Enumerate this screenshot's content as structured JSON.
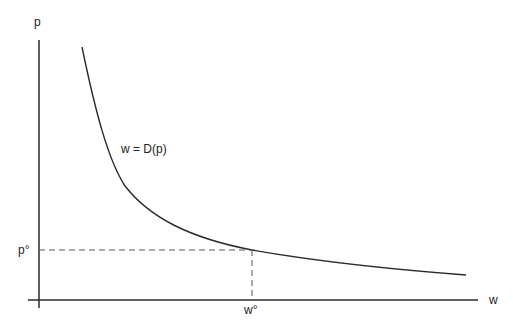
{
  "diagram": {
    "y_axis_label": "p",
    "x_axis_label": "w",
    "curve_label": "w = D(p)",
    "p_star_label": "p°",
    "w_star_label": "w°",
    "colors": {
      "line": "#2a2a2a",
      "dashed": "#555555",
      "background": "#ffffff"
    }
  }
}
